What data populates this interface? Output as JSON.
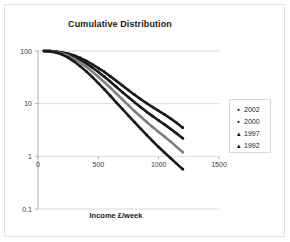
{
  "chart_data": {
    "type": "line",
    "title": "Cumulative Distribution",
    "xlabel": "Income £/week",
    "ylabel": "",
    "yscale": "log",
    "xlim": [
      0,
      1500
    ],
    "ylim": [
      0.1,
      100
    ],
    "xticks": [
      "0",
      "500",
      "1000",
      "1500"
    ],
    "xtick_values": [
      0,
      500,
      1000,
      1500
    ],
    "yticks": [
      "100",
      "10",
      "1",
      "0.1"
    ],
    "ytick_values": [
      100,
      10,
      1,
      0.1
    ],
    "grid": "horizontal",
    "legend_position": "right",
    "series": [
      {
        "name": "2002",
        "marker": "square",
        "color": "#1a1a1a",
        "x": [
          50,
          100,
          150,
          200,
          250,
          300,
          350,
          400,
          450,
          500,
          550,
          600,
          650,
          700,
          750,
          800,
          850,
          900,
          950,
          1000,
          1050,
          1100,
          1150,
          1200
        ],
        "y": [
          100,
          99.5,
          97.5,
          94,
          89,
          82,
          74,
          65,
          56,
          47.5,
          40,
          33,
          27,
          22,
          18,
          14.8,
          12.2,
          10.2,
          8.6,
          7.3,
          6.2,
          5.2,
          4.3,
          3.5
        ]
      },
      {
        "name": "2000",
        "marker": "square",
        "color": "#1a1a1a",
        "x": [
          50,
          100,
          150,
          200,
          250,
          300,
          350,
          400,
          450,
          500,
          550,
          600,
          650,
          700,
          750,
          800,
          850,
          900,
          950,
          1000,
          1050,
          1100,
          1150,
          1200
        ],
        "y": [
          100,
          99.3,
          96.5,
          92,
          85.5,
          77,
          67.5,
          58,
          48.5,
          40,
          32.5,
          26,
          20.8,
          16.5,
          13.2,
          10.6,
          8.6,
          7.0,
          5.8,
          4.8,
          4.0,
          3.3,
          2.7,
          2.2
        ]
      },
      {
        "name": "1997",
        "marker": "triangle",
        "color": "#808080",
        "x": [
          50,
          100,
          150,
          200,
          250,
          300,
          350,
          400,
          450,
          500,
          550,
          600,
          650,
          700,
          750,
          800,
          850,
          900,
          950,
          1000,
          1050,
          1100,
          1150,
          1200
        ],
        "y": [
          100,
          99,
          95.5,
          89.5,
          81,
          71,
          60.5,
          50,
          40.5,
          32.3,
          25.5,
          20,
          15.5,
          12.0,
          9.3,
          7.2,
          5.7,
          4.5,
          3.6,
          2.9,
          2.35,
          1.9,
          1.5,
          1.2
        ]
      },
      {
        "name": "1992",
        "marker": "triangle",
        "color": "#1a1a1a",
        "x": [
          50,
          100,
          150,
          200,
          250,
          300,
          350,
          400,
          450,
          500,
          550,
          600,
          650,
          700,
          750,
          800,
          850,
          900,
          950,
          1000,
          1050,
          1100,
          1150,
          1200
        ],
        "y": [
          100,
          98.5,
          93.5,
          85.5,
          75,
          63,
          51.5,
          41,
          32,
          24.5,
          18.6,
          14.0,
          10.5,
          7.9,
          5.9,
          4.45,
          3.35,
          2.55,
          1.95,
          1.5,
          1.17,
          0.92,
          0.72,
          0.57
        ]
      }
    ]
  },
  "legend": {
    "items": [
      {
        "label": "2002",
        "glyph": "▪"
      },
      {
        "label": "2000",
        "glyph": "▪"
      },
      {
        "label": "1997",
        "glyph": "▴"
      },
      {
        "label": "1992",
        "glyph": "▴"
      }
    ]
  }
}
